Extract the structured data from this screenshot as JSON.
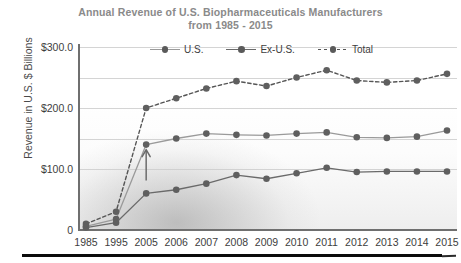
{
  "title": {
    "line1": "Annual Revenue of U.S. Biopharmaceuticals Manufacturers",
    "line2": "from 1985 - 2015"
  },
  "axes": {
    "ylabel": "Revenue in U.S. $ Billions",
    "yticks": [
      "$300.0",
      "$200.0",
      "$100.0",
      "0"
    ],
    "ytick_values": [
      300,
      200,
      100,
      0
    ]
  },
  "legend": {
    "position": "top-center-inside",
    "items": [
      {
        "label": "U.S.",
        "color": "#9a9a9a",
        "style": "solid"
      },
      {
        "label": "Ex-U.S.",
        "color": "#6a6a6a",
        "style": "solid"
      },
      {
        "label": "Total",
        "color": "#555555",
        "style": "dashed"
      }
    ]
  },
  "annotation": {
    "type": "arrow-up-icon",
    "target_series": "U.S.",
    "target_category": "2005",
    "color": "#6b6b6b"
  },
  "colors": {
    "us_line": "#9a9a9a",
    "exus_line": "#6a6a6a",
    "total_line": "#555555",
    "marker": "#5f5f5f",
    "axis": "#6f6f6f",
    "grid": "#cdcdcd",
    "title_text": "#8a8a8a",
    "tick_text": "#3d3d3d",
    "bottom_bar": "#0b0b0b"
  },
  "chart_data": {
    "type": "line",
    "title": "Annual Revenue of U.S. Biopharmaceuticals Manufacturers from 1985 - 2015",
    "xlabel": "",
    "ylabel": "Revenue in U.S. $ Billions",
    "ylim": [
      0,
      300
    ],
    "yticks": [
      0,
      100,
      200,
      300
    ],
    "grid": true,
    "legend": "top-center",
    "categories": [
      "1985",
      "1995",
      "2005",
      "2006",
      "2007",
      "2008",
      "2009",
      "2010",
      "2011",
      "2012",
      "2013",
      "2014",
      "2015"
    ],
    "series": [
      {
        "name": "U.S.",
        "style": "solid",
        "color": "#9a9a9a",
        "values": [
          6,
          18,
          140,
          150,
          158,
          156,
          155,
          158,
          160,
          152,
          151,
          153,
          163
        ]
      },
      {
        "name": "Ex-U.S.",
        "style": "solid",
        "color": "#6a6a6a",
        "values": [
          4,
          12,
          60,
          66,
          76,
          90,
          84,
          93,
          102,
          95,
          96,
          96,
          96
        ]
      },
      {
        "name": "Total",
        "style": "dashed",
        "color": "#555555",
        "values": [
          10,
          30,
          200,
          216,
          232,
          244,
          236,
          250,
          262,
          245,
          242,
          245,
          256
        ]
      }
    ]
  }
}
